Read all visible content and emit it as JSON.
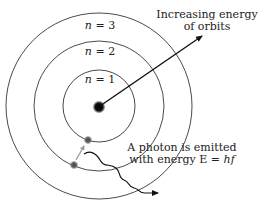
{
  "diagram": {
    "type": "bohr-model",
    "orbits": [
      {
        "label_var": "n",
        "label_eq": " = 1",
        "radius": 36
      },
      {
        "label_var": "n",
        "label_eq": " = 2",
        "radius": 65
      },
      {
        "label_var": "n",
        "label_eq": " = 3",
        "radius": 93
      }
    ],
    "annotations": {
      "energy_arrow_line1": "Increasing energy",
      "energy_arrow_line2": "of orbits",
      "photon_line1": "A photon is emitted",
      "photon_line2_prefix": "with energy E = ",
      "photon_line2_formula": "hf"
    },
    "colors": {
      "orbit": "#4a4a4a",
      "nucleus": "#111111",
      "electron": "#5a5a5a",
      "transition_arrow": "#9a9a9a",
      "photon": "#111111"
    }
  }
}
